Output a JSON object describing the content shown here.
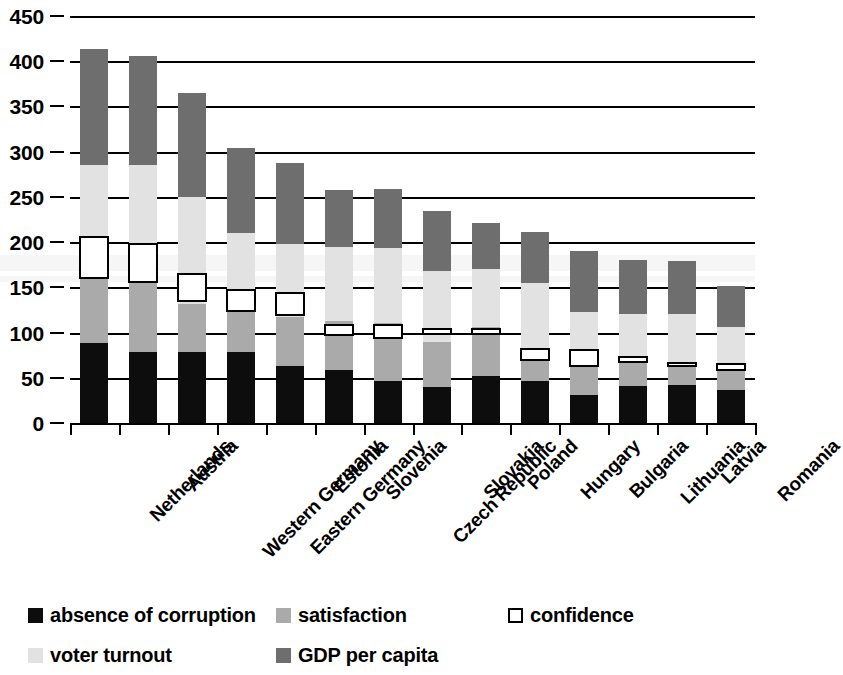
{
  "chart_data": {
    "type": "bar",
    "subtype": "stacked-bar-with-marker",
    "title": "",
    "xlabel": "",
    "ylabel": "",
    "ylim": [
      0,
      450
    ],
    "ytick_step": 50,
    "yticks": [
      0,
      50,
      100,
      150,
      200,
      250,
      300,
      350,
      400,
      450
    ],
    "grid": true,
    "grid_axis": "y",
    "legend_position": "bottom",
    "categories": [
      "Netherlands",
      "Austria",
      "Western Germany",
      "Eastern Germany",
      "Estonia",
      "Slovenia",
      "Czech Republic",
      "Slovakia",
      "Poland",
      "Hungary",
      "Bulgaria",
      "Lithuania",
      "Latvia",
      "Romania"
    ],
    "series": [
      {
        "name": "absence of corruption",
        "color": "#0d0d0d",
        "values": [
          89,
          78,
          79,
          79,
          63,
          59,
          46,
          40,
          52,
          46,
          31,
          41,
          42,
          36
        ]
      },
      {
        "name": "satisfaction",
        "color": "#aaaaaa",
        "values": [
          81,
          85,
          53,
          52,
          54,
          54,
          65,
          50,
          54,
          30,
          32,
          29,
          22,
          26
        ]
      },
      {
        "name": "voter turnout",
        "color": "#e2e2e2",
        "values": [
          115,
          122,
          118,
          79,
          81,
          82,
          82,
          78,
          64,
          79,
          60,
          51,
          56,
          44
        ]
      },
      {
        "name": "GDP per capita",
        "color": "#6e6e6e",
        "values": [
          129,
          121,
          115,
          94,
          89,
          63,
          66,
          66,
          51,
          56,
          67,
          59,
          59,
          45
        ]
      }
    ],
    "marker_series": {
      "name": "confidence",
      "color": "#ffffff",
      "border_color": "#000000",
      "values": [
        183,
        177,
        150,
        135,
        131,
        103,
        101,
        101,
        101,
        76,
        72,
        70,
        65,
        62
      ],
      "spans": [
        [
          159,
          207
        ],
        [
          155,
          199
        ],
        [
          134,
          166
        ],
        [
          123,
          148
        ],
        [
          118,
          145
        ],
        [
          96,
          110
        ],
        [
          93,
          110
        ],
        [
          97,
          105
        ],
        [
          97,
          105
        ],
        [
          69,
          83
        ],
        [
          62,
          82
        ],
        [
          66,
          74
        ],
        [
          62,
          68
        ],
        [
          58,
          66
        ]
      ]
    },
    "totals": [
      414,
      406,
      365,
      304,
      287,
      258,
      259,
      234,
      221,
      211,
      190,
      180,
      179,
      151
    ]
  },
  "axis": {
    "y_tick_labels": [
      "450",
      "400",
      "350",
      "300",
      "250",
      "200",
      "150",
      "100",
      "50",
      "0"
    ]
  },
  "legend": {
    "items": [
      {
        "label": "absence of corruption",
        "swatch": "black-square-swatch"
      },
      {
        "label": "satisfaction",
        "swatch": "medium-gray-square-swatch"
      },
      {
        "label": "confidence",
        "swatch": "white-outline-square-swatch"
      },
      {
        "label": "voter turnout",
        "swatch": "light-gray-square-swatch"
      },
      {
        "label": "GDP per capita",
        "swatch": "dark-gray-square-swatch"
      }
    ]
  }
}
